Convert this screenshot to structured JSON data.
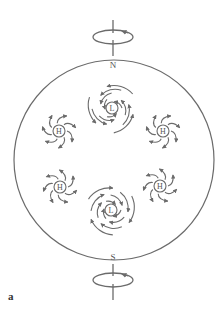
{
  "figure": {
    "panel_label": "a",
    "poles": {
      "north": "N",
      "south": "S"
    },
    "systems": [
      {
        "type": "H",
        "x": 59,
        "y": 131,
        "hemisphere": "north"
      },
      {
        "type": "L",
        "x": 112,
        "y": 108,
        "hemisphere": "north"
      },
      {
        "type": "H",
        "x": 163,
        "y": 131,
        "hemisphere": "north"
      },
      {
        "type": "H",
        "x": 60,
        "y": 187,
        "hemisphere": "south"
      },
      {
        "type": "L",
        "x": 111,
        "y": 210,
        "hemisphere": "south"
      },
      {
        "type": "H",
        "x": 160,
        "y": 186,
        "hemisphere": "south"
      }
    ],
    "colors": {
      "stroke": "#6b6b6b",
      "text": "#555555"
    }
  }
}
